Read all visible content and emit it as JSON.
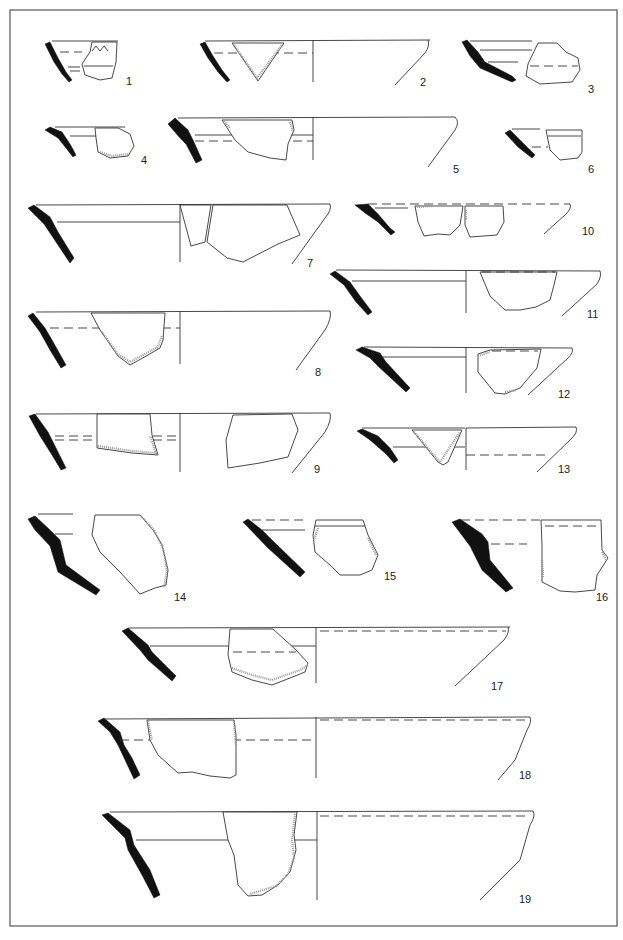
{
  "plate": {
    "type": "archaeological pottery drawing plate",
    "frame_color": "#555555",
    "profile_color": "#111111",
    "figures": [
      {
        "id": 1,
        "label": "1"
      },
      {
        "id": 2,
        "label": "2"
      },
      {
        "id": 3,
        "label": "3"
      },
      {
        "id": 4,
        "label": "4"
      },
      {
        "id": 5,
        "label": "5"
      },
      {
        "id": 6,
        "label": "6"
      },
      {
        "id": 7,
        "label": "7"
      },
      {
        "id": 8,
        "label": "8"
      },
      {
        "id": 9,
        "label": "9"
      },
      {
        "id": 10,
        "label": "10"
      },
      {
        "id": 11,
        "label": "11"
      },
      {
        "id": 12,
        "label": "12"
      },
      {
        "id": 13,
        "label": "13"
      },
      {
        "id": 14,
        "label": "14"
      },
      {
        "id": 15,
        "label": "15"
      },
      {
        "id": 16,
        "label": "16"
      },
      {
        "id": 17,
        "label": "17"
      },
      {
        "id": 18,
        "label": "18"
      },
      {
        "id": 19,
        "label": "19"
      }
    ]
  }
}
